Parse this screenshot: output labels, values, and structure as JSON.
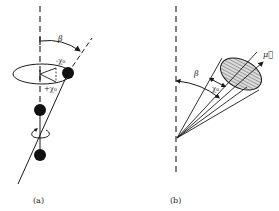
{
  "figure": {
    "panel_a": {
      "caption": "(a)",
      "angle_label": "β",
      "minus_chi": "-χ₀",
      "plus_chi": "+χ₀"
    },
    "panel_b": {
      "caption": "(b)",
      "angle_label": "β",
      "chi_label": "χ₀",
      "vector_label": "μ⃗"
    },
    "colors": {
      "stroke": "#1a1a1a",
      "hatch": "#9a9a9a",
      "fill": "#d9d9d9"
    }
  }
}
